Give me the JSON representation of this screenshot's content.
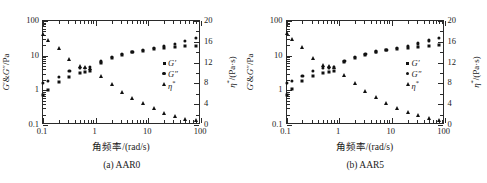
{
  "figure": {
    "panels": [
      {
        "caption": "(a) AAR0",
        "xlabel": "角频率/(rad/s)",
        "ylabel_left": "G′&G″/Pa",
        "ylabel_right": "η*/(Pa·s)",
        "xticks": [
          "0.1",
          "1",
          "10",
          "100"
        ],
        "yticks_left": [
          "0.1",
          "1",
          "10",
          "100"
        ],
        "yticks_right": [
          "0",
          "4",
          "8",
          "12",
          "16",
          "20"
        ],
        "legend": [
          {
            "label": "G′",
            "marker": "square-marker"
          },
          {
            "label": "G″",
            "marker": "circle-marker"
          },
          {
            "label": "η*",
            "marker": "triangle-marker"
          }
        ]
      },
      {
        "caption": "(b) AAR5",
        "xlabel": "角频率/(rad/s)",
        "ylabel_left": "G′&G″/Pa",
        "ylabel_right": "η*/(Pa·s)",
        "xticks": [
          "0.1",
          "1",
          "10",
          "100"
        ],
        "yticks_left": [
          "0.1",
          "1",
          "10",
          "100"
        ],
        "yticks_right": [
          "0",
          "4",
          "8",
          "12",
          "16",
          "20"
        ],
        "legend": [
          {
            "label": "G′",
            "marker": "square-marker"
          },
          {
            "label": "G″",
            "marker": "circle-marker"
          },
          {
            "label": "η*",
            "marker": "triangle-marker"
          }
        ]
      }
    ]
  },
  "chart_data": [
    {
      "type": "scatter",
      "title": "(a) AAR0",
      "xlabel": "角频率/(rad/s)",
      "ylabel": "G′&G″/Pa",
      "ylabel_secondary": "η*/(Pa·s)",
      "xscale": "log",
      "yscale": "log",
      "xlim": [
        0.1,
        100
      ],
      "ylim": [
        0.1,
        100
      ],
      "ylim_secondary": [
        0,
        20
      ],
      "grid": false,
      "legend_position": "center-right",
      "series": [
        {
          "name": "G′",
          "axis": "left",
          "marker": "square",
          "x": [
            0.1,
            0.126,
            0.2,
            0.316,
            0.5,
            0.63,
            0.79,
            1.26,
            2.0,
            3.16,
            5.0,
            7.9,
            12.6,
            20.0,
            31.6,
            50.0,
            79.0
          ],
          "y": [
            0.72,
            1.05,
            1.75,
            2.5,
            3.1,
            3.3,
            3.6,
            6.2,
            8.6,
            10.5,
            12.5,
            14.0,
            15.5,
            16.5,
            17.5,
            18.5,
            19.5
          ]
        },
        {
          "name": "G″",
          "axis": "left",
          "marker": "circle",
          "x": [
            0.1,
            0.126,
            0.2,
            0.316,
            0.5,
            0.63,
            0.79,
            1.26,
            2.0,
            3.16,
            5.0,
            7.9,
            12.6,
            20.0,
            31.6,
            50.0,
            79.0
          ],
          "y": [
            1.6,
            1.85,
            2.5,
            3.6,
            4.4,
            4.5,
            4.7,
            6.8,
            9.0,
            11.0,
            13.0,
            14.5,
            17.0,
            19.0,
            22.0,
            27.0,
            32.0
          ]
        },
        {
          "name": "η*",
          "axis": "right",
          "marker": "triangle",
          "x": [
            0.1,
            0.126,
            0.2,
            0.316,
            0.5,
            0.63,
            0.79,
            1.26,
            2.0,
            3.16,
            5.0,
            7.9,
            12.6,
            20.0,
            31.6,
            50.0,
            79.0
          ],
          "y": [
            17.5,
            16.4,
            14.8,
            12.6,
            11.4,
            11.2,
            11.0,
            9.4,
            7.8,
            6.4,
            5.2,
            4.2,
            3.2,
            2.4,
            1.8,
            1.2,
            0.9
          ]
        }
      ]
    },
    {
      "type": "scatter",
      "title": "(b) AAR5",
      "xlabel": "角频率/(rad/s)",
      "ylabel": "G′&G″/Pa",
      "ylabel_secondary": "η*/(Pa·s)",
      "xscale": "log",
      "yscale": "log",
      "xlim": [
        0.1,
        100
      ],
      "ylim": [
        0.1,
        100
      ],
      "ylim_secondary": [
        0,
        20
      ],
      "grid": false,
      "legend_position": "center-right",
      "series": [
        {
          "name": "G′",
          "axis": "left",
          "marker": "square",
          "x": [
            0.1,
            0.126,
            0.2,
            0.316,
            0.5,
            0.63,
            0.79,
            1.26,
            2.0,
            3.16,
            5.0,
            7.9,
            12.6,
            20.0,
            31.6,
            50.0,
            79.0
          ],
          "y": [
            0.74,
            1.1,
            1.8,
            2.6,
            3.2,
            3.4,
            3.7,
            6.4,
            8.8,
            10.8,
            12.8,
            14.2,
            15.8,
            16.8,
            17.8,
            18.8,
            19.8
          ]
        },
        {
          "name": "G″",
          "axis": "left",
          "marker": "circle",
          "x": [
            0.1,
            0.126,
            0.2,
            0.316,
            0.5,
            0.63,
            0.79,
            1.26,
            2.0,
            3.16,
            5.0,
            7.9,
            12.6,
            20.0,
            31.6,
            50.0,
            79.0
          ],
          "y": [
            1.65,
            1.9,
            2.6,
            3.7,
            4.5,
            4.6,
            4.8,
            7.0,
            9.2,
            11.2,
            13.2,
            14.8,
            17.2,
            19.2,
            22.5,
            27.5,
            33.0
          ]
        },
        {
          "name": "η*",
          "axis": "right",
          "marker": "triangle",
          "x": [
            0.1,
            0.126,
            0.2,
            0.316,
            0.5,
            0.63,
            0.79,
            1.26,
            2.0,
            3.16,
            5.0,
            7.9,
            12.6,
            20.0,
            31.6,
            50.0,
            79.0
          ],
          "y": [
            17.6,
            16.6,
            15.0,
            12.8,
            11.6,
            11.3,
            11.1,
            9.6,
            8.0,
            6.6,
            5.3,
            4.3,
            3.3,
            2.5,
            1.9,
            1.3,
            1.0
          ]
        }
      ]
    }
  ]
}
